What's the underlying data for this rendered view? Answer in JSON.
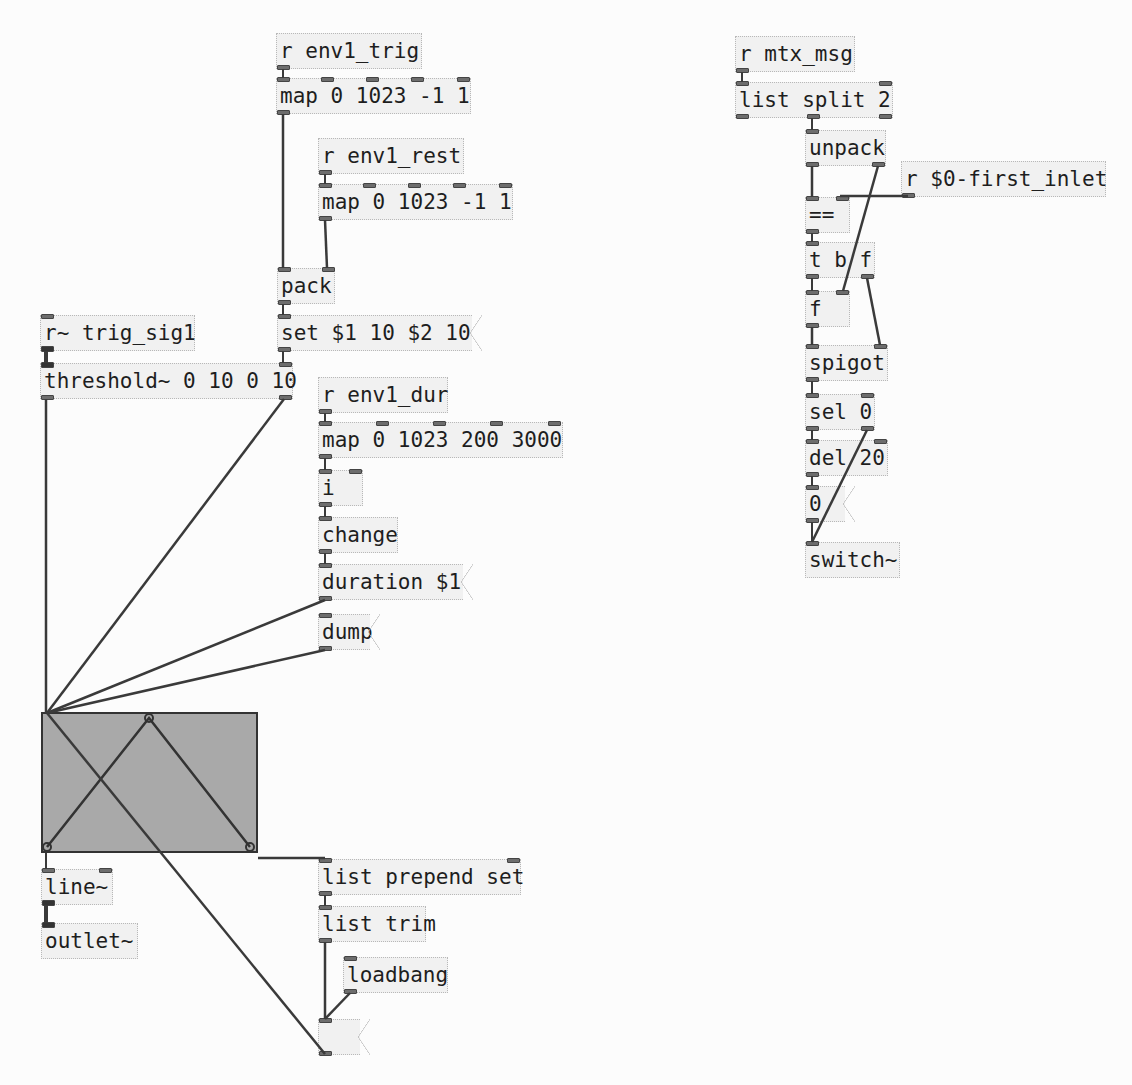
{
  "patch": {
    "left_column": {
      "r_env1_trig": "r env1_trig",
      "map_trig": "map 0 1023 -1 1",
      "r_env1_rest": "r env1_rest",
      "map_rest": "map 0 1023 -1 1",
      "pack": "pack",
      "set_msg": "set $1 10 $2 10",
      "r_trig_sig1": "r~ trig_sig1",
      "threshold": "threshold~ 0 10 0 10",
      "r_env1_dur": "r env1_dur",
      "map_dur": "map 0 1023 200 3000",
      "int": "i",
      "change": "change",
      "duration_msg": "duration $1",
      "dump_msg": "dump",
      "line": "line~",
      "outlet": "outlet~",
      "list_prepend": "list prepend set",
      "list_trim": "list trim",
      "loadbang": "loadbang",
      "empty_msg": ""
    },
    "right_column": {
      "r_mtx_msg": "r mtx_msg",
      "list_split": "list split 2",
      "unpack": "unpack",
      "r_first_inlet": "r $0-first_inlet",
      "eq": "==",
      "trigger": "t b f",
      "float": "f",
      "spigot": "spigot",
      "sel": "sel 0",
      "del": "del 20",
      "zero_msg": "0",
      "switch": "switch~"
    },
    "envelope_graph": {
      "points": [
        [
          0,
          1
        ],
        [
          0.5,
          0
        ],
        [
          1,
          1
        ]
      ],
      "fill": "#a9a9a9"
    }
  }
}
